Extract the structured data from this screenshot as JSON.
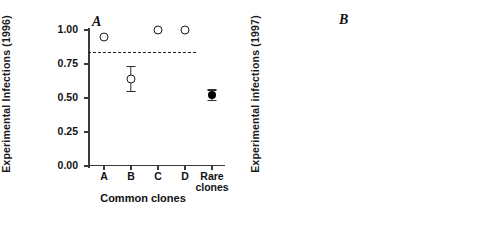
{
  "figure": {
    "width": 494,
    "height": 236,
    "background": "#ffffff",
    "ink_color": "#111111"
  },
  "chart_data": [
    {
      "type": "scatter",
      "panel_label": "A",
      "title": "",
      "xlabel": "Common clones",
      "ylabel": "Experimental Infections (1996)",
      "categories": [
        "A",
        "B",
        "C",
        "D",
        "Rare\nclones"
      ],
      "x": [
        1,
        2,
        3,
        4,
        5
      ],
      "ylim": [
        0.0,
        1.0
      ],
      "ytick_values": [
        0.0,
        0.25,
        0.5,
        0.75,
        1.0
      ],
      "ytick_labels": [
        "0.00",
        "0.25",
        "0.50",
        "0.75",
        "1.00"
      ],
      "grid": false,
      "legend": "none",
      "series": [
        {
          "name": "Common clones (open circles) and rare clones (filled circle)",
          "marker": [
            "circle-open",
            "circle-open",
            "circle-open",
            "circle-open",
            "circle-filled"
          ],
          "values": [
            0.95,
            0.64,
            1.0,
            1.0,
            0.52
          ],
          "err_low": [
            0.0,
            0.09,
            0.0,
            0.0,
            0.04
          ],
          "err_high": [
            0.0,
            0.09,
            0.0,
            0.0,
            0.04
          ]
        }
      ],
      "annotations": [
        {
          "type": "reference-line",
          "style": "dashed",
          "y": 0.835,
          "x_start": 0.4,
          "x_end": 4.4,
          "label": "mean of common clones"
        }
      ]
    },
    {
      "type": "scatter",
      "panel_label": "B",
      "title": "",
      "xlabel": "Common clones",
      "ylabel": "Experimental infections (1997)",
      "categories": [
        "A",
        "B",
        "C",
        "D",
        "Rare\nclones"
      ],
      "x": [
        1,
        2,
        3,
        4,
        5
      ],
      "ylim": [
        0.0,
        1.0
      ],
      "ytick_values": [
        0.0,
        0.25,
        0.5,
        0.75,
        1.0
      ],
      "ytick_labels": [
        "0.00",
        "0.25",
        "0.50",
        "0.75",
        "1.00"
      ],
      "grid": false,
      "legend": "none",
      "series": [
        {
          "name": "Upper series (circles)",
          "marker": [
            "circle-open",
            "circle-open",
            "circle-open",
            "circle-open",
            "circle-filled"
          ],
          "values": [
            0.94,
            0.87,
            0.93,
            0.79,
            0.66
          ],
          "err_low": [
            0.035,
            0.09,
            0.035,
            0.04,
            0.03
          ],
          "err_high": [
            0.035,
            0.08,
            0.045,
            0.05,
            0.03
          ]
        },
        {
          "name": "Lower series (squares)",
          "marker": [
            "square-open",
            "square-open",
            "square-open",
            "square-open",
            "square-filled"
          ],
          "values": [
            0.07,
            0.11,
            0.26,
            0.12,
            0.08
          ],
          "err_low": [
            0.05,
            0.07,
            0.07,
            0.035,
            0.0
          ],
          "err_high": [
            0.04,
            0.06,
            0.065,
            0.035,
            0.0
          ]
        }
      ],
      "annotations": [
        {
          "type": "reference-line",
          "style": "dashed",
          "y": 0.84,
          "x_start": 0.45,
          "x_end": 4.45,
          "label": "mean of common clones (upper)"
        },
        {
          "type": "reference-line",
          "style": "dashed",
          "y": 0.128,
          "x_start": 0.45,
          "x_end": 4.45,
          "label": "mean of common clones (lower)"
        }
      ]
    }
  ]
}
